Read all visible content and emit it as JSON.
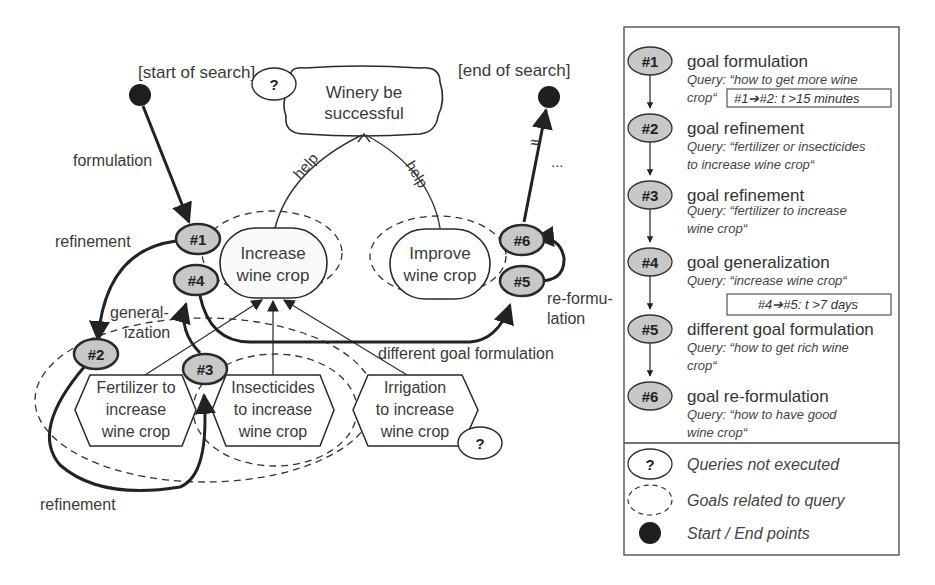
{
  "diagram": {
    "start_label": "[start of search]",
    "end_label": "[end of search]",
    "top_goal": {
      "line1": "Winery be",
      "line2": "successful",
      "question_mark": "?"
    },
    "help_left": "help",
    "help_right": "help",
    "ellipsis": "...",
    "goal_increase": {
      "line1": "Increase",
      "line2": "wine crop"
    },
    "goal_improve": {
      "line1": "Improve",
      "line2": "wine crop"
    },
    "task_fertilizer": {
      "line1": "Fertilizer to",
      "line2": "increase",
      "line3": "wine crop"
    },
    "task_insecticides": {
      "line1": "Insecticides",
      "line2": "to increase",
      "line3": "wine crop"
    },
    "task_irrigation": {
      "line1": "Irrigation",
      "line2": "to increase",
      "line3": "wine crop",
      "question_mark": "?"
    },
    "nodes": {
      "n1": "#1",
      "n2": "#2",
      "n3": "#3",
      "n4": "#4",
      "n5": "#5",
      "n6": "#6"
    },
    "edge_labels": {
      "formulation": "formulation",
      "refinement_top": "refinement",
      "generalization_1": "general-",
      "generalization_2": "ization",
      "refinement_bottom": "refinement",
      "different_goal": "different goal formulation",
      "reformulation_1": "re-formu-",
      "reformulation_2": "lation"
    }
  },
  "legend": {
    "steps": [
      {
        "id": "#1",
        "title": "goal formulation",
        "query1": "Query: “how to get more wine",
        "query2": "crop“"
      },
      {
        "id": "#2",
        "title": "goal refinement",
        "query1": "Query: “fertilizer or insecticides",
        "query2": "to increase wine crop“"
      },
      {
        "id": "#3",
        "title": "goal refinement",
        "query1": "Query: “fertilizer to increase",
        "query2": "wine crop“"
      },
      {
        "id": "#4",
        "title": "goal generalization",
        "query1": "Query: “increase wine crop“",
        "query2": ""
      },
      {
        "id": "#5",
        "title": "different goal formulation",
        "query1": "Query: “how to get rich wine",
        "query2": "crop“"
      },
      {
        "id": "#6",
        "title": "goal re-formulation",
        "query1": "Query: “how to have good",
        "query2": "wine crop“"
      }
    ],
    "time_boxes": [
      {
        "text": "#1➔#2: t >15 minutes"
      },
      {
        "text": "#4➔#5: t >7 days"
      }
    ],
    "keys": [
      {
        "symbol": "?",
        "label": "Queries not executed"
      },
      {
        "symbol": "",
        "label": "Goals related to query"
      },
      {
        "symbol": "",
        "label": "Start / End points"
      }
    ]
  },
  "colors": {
    "node_fill": "#c8c8c8",
    "stroke": "#2a2a2a",
    "text": "#3a3a3a",
    "start_end_fill": "#1e1e1e"
  }
}
